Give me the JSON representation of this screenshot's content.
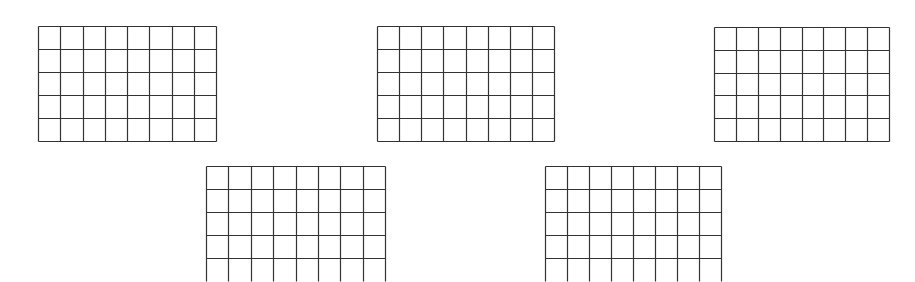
{
  "figure": {
    "background": "#ffffff",
    "line_color": "#333333",
    "grids": [
      {
        "id": "grid-1",
        "x": 38,
        "y": 26,
        "width": 178,
        "height": 115,
        "cols": 8,
        "rows": 5,
        "row_height": 23,
        "clipped_bottom": false
      },
      {
        "id": "grid-2",
        "x": 377,
        "y": 26,
        "width": 177,
        "height": 115,
        "cols": 8,
        "rows": 5,
        "row_height": 23,
        "clipped_bottom": false
      },
      {
        "id": "grid-3",
        "x": 714,
        "y": 27,
        "width": 175,
        "height": 114,
        "cols": 8,
        "rows": 5,
        "row_height": 22.8,
        "clipped_bottom": false
      },
      {
        "id": "grid-4",
        "x": 206,
        "y": 166,
        "width": 179,
        "height": 115,
        "cols": 8,
        "rows": 5,
        "row_height": 23,
        "clipped_bottom": true
      },
      {
        "id": "grid-5",
        "x": 545,
        "y": 166,
        "width": 176,
        "height": 115,
        "cols": 8,
        "rows": 5,
        "row_height": 23,
        "clipped_bottom": true
      }
    ]
  }
}
